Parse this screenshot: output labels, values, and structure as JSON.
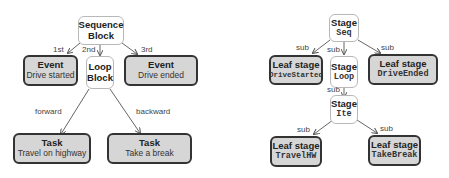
{
  "left": {
    "root": {
      "title": "Sequence",
      "sub": "Block"
    },
    "event1": {
      "title": "Event",
      "sub": "Drive started"
    },
    "loop": {
      "title": "Loop",
      "sub": "Block"
    },
    "event2": {
      "title": "Event",
      "sub": "Drive ended"
    },
    "task1": {
      "title": "Task",
      "sub": "Travel on highway"
    },
    "task2": {
      "title": "Task",
      "sub": "Take a break"
    },
    "edges": {
      "e1": "1st",
      "e2": "2nd",
      "e3": "3rd",
      "e4": "forward",
      "e5": "backward"
    }
  },
  "right": {
    "root": {
      "title": "Stage",
      "sub": "Seq"
    },
    "leaf1": {
      "title": "Leaf stage",
      "sub": "DriveStarted"
    },
    "loop": {
      "title": "Stage",
      "sub": "Loop"
    },
    "leaf2": {
      "title": "Leaf stage",
      "sub": "DriveEnded"
    },
    "ite": {
      "title": "Stage",
      "sub": "Ite"
    },
    "leaf3": {
      "title": "Leaf stage",
      "sub": "TravelHW"
    },
    "leaf4": {
      "title": "Leaf stage",
      "sub": "TakeBreak"
    },
    "edges": {
      "e1": "sub",
      "e2": "sub",
      "e3": "sub",
      "e4": "sub",
      "e5": "sub",
      "e6": "sub"
    }
  }
}
